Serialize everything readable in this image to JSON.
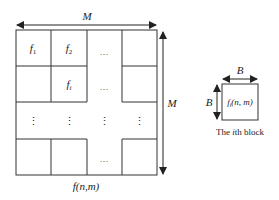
{
  "diagram": {
    "image": {
      "width_label": "M",
      "height_label": "M",
      "function_label": "f(n,m)",
      "cells": {
        "f1": "f",
        "f1_sub": "1",
        "f2": "f",
        "f2_sub": "2",
        "fi": "f",
        "fi_sub": "i",
        "h_ellipsis": "…",
        "v_ellipsis": "⋮"
      }
    },
    "block": {
      "width_label": "B",
      "height_label": "B",
      "content": "f",
      "content_sub": "i",
      "content_args": "(n, m)",
      "caption_prefix": "The ",
      "caption_italic": "i",
      "caption_suffix": "th block"
    }
  },
  "colors": {
    "stroke": "#333333",
    "text": "#222222",
    "background": "#ffffff"
  }
}
